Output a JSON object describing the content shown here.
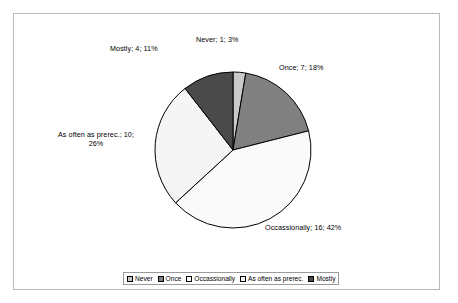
{
  "chart_data": {
    "type": "pie",
    "title": "",
    "categories": [
      "Never",
      "Once",
      "Occassionally",
      "As often as prerec.",
      "Mostly"
    ],
    "values": [
      1,
      7,
      16,
      10,
      4
    ],
    "percentages": [
      3,
      18,
      42,
      26,
      11
    ],
    "total": 38,
    "legend_position": "bottom",
    "grid": false,
    "slice_colors": [
      "#c9c9c9",
      "#808080",
      "#fafafa",
      "#f5f5f5",
      "#4a4a4a"
    ],
    "slice_outline_color": "#000000",
    "labels": [
      {
        "key": "never",
        "text": "Never; 1; 3%"
      },
      {
        "key": "once",
        "text": "Once; 7; 18%"
      },
      {
        "key": "occassionally",
        "text": "Occassionally; 16; 42%"
      },
      {
        "key": "as_often_as_prerec",
        "text": "As often as prerec.; 10; 26%"
      },
      {
        "key": "mostly",
        "text": "Mostly; 4; 11%"
      }
    ]
  },
  "legend": {
    "items": [
      {
        "label": "Never",
        "color": "#c9c9c9"
      },
      {
        "label": "Once",
        "color": "#808080"
      },
      {
        "label": "Occassionally",
        "color": "#fafafa"
      },
      {
        "label": "As often as prerec.",
        "color": "#f5f5f5"
      },
      {
        "label": "Mostly",
        "color": "#4a4a4a"
      }
    ]
  }
}
